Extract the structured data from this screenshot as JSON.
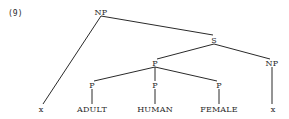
{
  "example_number": "(9)",
  "tree": {
    "nodes": [
      {
        "id": "np_root",
        "label": "NP",
        "x": 101,
        "y": 12
      },
      {
        "id": "s",
        "label": "S",
        "x": 214,
        "y": 40
      },
      {
        "id": "p_mid",
        "label": "P",
        "x": 155,
        "y": 63
      },
      {
        "id": "np_right",
        "label": "NP",
        "x": 272,
        "y": 63
      },
      {
        "id": "p_adult",
        "label": "P",
        "x": 92,
        "y": 85
      },
      {
        "id": "p_human",
        "label": "P",
        "x": 155,
        "y": 85
      },
      {
        "id": "p_female",
        "label": "P",
        "x": 219,
        "y": 85
      },
      {
        "id": "x_left",
        "label": "x",
        "x": 41,
        "y": 109
      },
      {
        "id": "adult",
        "label": "ADULT",
        "x": 92,
        "y": 109
      },
      {
        "id": "human",
        "label": "HUMAN",
        "x": 155,
        "y": 109
      },
      {
        "id": "female",
        "label": "FEMALE",
        "x": 219,
        "y": 109
      },
      {
        "id": "x_right",
        "label": "x",
        "x": 273,
        "y": 109
      }
    ],
    "edges": [
      {
        "x1": 101,
        "y1": 16,
        "x2": 43,
        "y2": 104
      },
      {
        "x1": 101,
        "y1": 16,
        "x2": 213,
        "y2": 35
      },
      {
        "x1": 214,
        "y1": 44,
        "x2": 157,
        "y2": 59
      },
      {
        "x1": 214,
        "y1": 44,
        "x2": 270,
        "y2": 59
      },
      {
        "x1": 155,
        "y1": 67,
        "x2": 94,
        "y2": 81
      },
      {
        "x1": 155,
        "y1": 67,
        "x2": 155,
        "y2": 81
      },
      {
        "x1": 155,
        "y1": 67,
        "x2": 217,
        "y2": 81
      },
      {
        "x1": 272,
        "y1": 67,
        "x2": 272,
        "y2": 104
      },
      {
        "x1": 92,
        "y1": 89,
        "x2": 92,
        "y2": 104
      },
      {
        "x1": 155,
        "y1": 89,
        "x2": 155,
        "y2": 104
      },
      {
        "x1": 219,
        "y1": 89,
        "x2": 219,
        "y2": 104
      }
    ]
  },
  "labels": {
    "np_root": "NP",
    "s": "S",
    "p_mid": "P",
    "np_right": "NP",
    "p_adult": "P",
    "p_human": "P",
    "p_female": "P",
    "x_left": "x",
    "adult": "ADULT",
    "human": "HUMAN",
    "female": "FEMALE",
    "x_right": "x"
  },
  "colors": {
    "ink": "#2a2a2a",
    "background": "#ffffff"
  }
}
